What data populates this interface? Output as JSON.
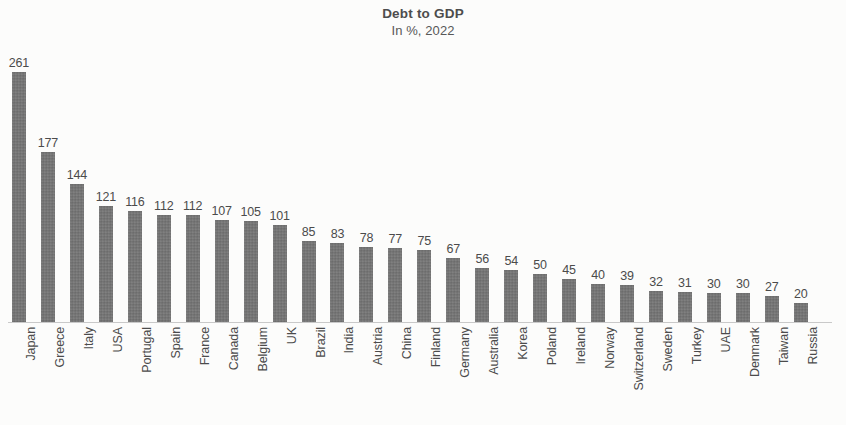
{
  "chart_data": {
    "type": "bar",
    "title": "Debt to GDP",
    "subtitle": "In %, 2022",
    "xlabel": "",
    "ylabel": "",
    "ylim": [
      0,
      261
    ],
    "grid": false,
    "legend": false,
    "orientation": "vertical",
    "bar_color": "#717171",
    "background_color": "#fcfcfb",
    "value_labels": true,
    "categories": [
      "Japan",
      "Greece",
      "Italy",
      "USA",
      "Portugal",
      "Spain",
      "France",
      "Canada",
      "Belgium",
      "UK",
      "Brazil",
      "India",
      "Austria",
      "China",
      "Finland",
      "Germany",
      "Australia",
      "Korea",
      "Poland",
      "Ireland",
      "Norway",
      "Switzerland",
      "Sweden",
      "Turkey",
      "UAE",
      "Denmark",
      "Taiwan",
      "Russia"
    ],
    "values": [
      261,
      177,
      144,
      121,
      116,
      112,
      112,
      107,
      105,
      101,
      85,
      83,
      78,
      77,
      75,
      67,
      56,
      54,
      50,
      45,
      40,
      39,
      32,
      31,
      30,
      30,
      27,
      20
    ]
  }
}
